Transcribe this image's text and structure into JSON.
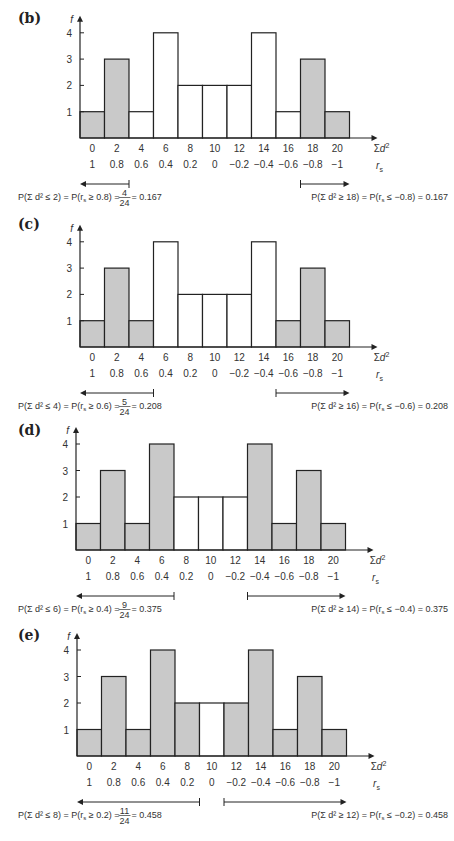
{
  "chart_data": [
    {
      "panel": "(b)",
      "type": "bar",
      "title": "",
      "ylabel": "f",
      "xlabel": "Σd²",
      "x2label": "r_s",
      "categories": [
        "0",
        "2",
        "4",
        "6",
        "8",
        "10",
        "12",
        "14",
        "16",
        "18",
        "20"
      ],
      "rs_labels": [
        "1",
        "0.8",
        "0.6",
        "0.4",
        "0.2",
        "0",
        "−0.2",
        "−0.4",
        "−0.6",
        "−0.8",
        "−1"
      ],
      "values": [
        1,
        3,
        1,
        4,
        2,
        2,
        2,
        4,
        1,
        3,
        1
      ],
      "shaded": [
        true,
        true,
        false,
        false,
        false,
        false,
        false,
        false,
        false,
        true,
        true
      ],
      "yticks": [
        1,
        2,
        3,
        4
      ],
      "ylim": [
        0,
        4
      ],
      "left_tail": {
        "text": "P(Σ d² ≤ 2) = P(r_s ≥ 0.8) = 4/24 = 0.167",
        "pre": "P(Σ d² ≤ 2) = P(r",
        "sub": "s",
        "post": " ≥ 0.8) = ",
        "num": "4",
        "den": "24",
        "result": " = 0.167",
        "from_bar": 0,
        "to_bar": 1
      },
      "right_tail": {
        "text": "P(Σ d² ≥ 18) = P(r_s ≤ −0.8) = 0.167",
        "pre": "P(Σ d² ≥ 18) = P(r",
        "sub": "s",
        "post": " ≤ −0.8) = 0.167",
        "from_bar": 9,
        "to_bar": 10
      }
    },
    {
      "panel": "(c)",
      "type": "bar",
      "ylabel": "f",
      "xlabel": "Σd²",
      "x2label": "r_s",
      "categories": [
        "0",
        "2",
        "4",
        "6",
        "8",
        "10",
        "12",
        "14",
        "16",
        "18",
        "20"
      ],
      "rs_labels": [
        "1",
        "0.8",
        "0.6",
        "0.4",
        "0.2",
        "0",
        "−0.2",
        "−0.4",
        "−0.6",
        "−0.8",
        "−1"
      ],
      "values": [
        1,
        3,
        1,
        4,
        2,
        2,
        2,
        4,
        1,
        3,
        1
      ],
      "shaded": [
        true,
        true,
        true,
        false,
        false,
        false,
        false,
        false,
        true,
        true,
        true
      ],
      "yticks": [
        1,
        2,
        3,
        4
      ],
      "ylim": [
        0,
        4
      ],
      "left_tail": {
        "text": "P(Σ d² ≤ 4) = P(r_s ≥ 0.6) = 5/24 = 0.208",
        "pre": "P(Σ d² ≤ 4) = P(r",
        "sub": "s",
        "post": " ≥ 0.6) = ",
        "num": "5",
        "den": "24",
        "result": " = 0.208",
        "from_bar": 0,
        "to_bar": 2
      },
      "right_tail": {
        "text": "P(Σ d² ≥ 16) = P(r_s ≤ −0.6) = 0.208",
        "pre": "P(Σ d² ≥ 16) = P(r",
        "sub": "s",
        "post": " ≤ −0.6) = 0.208",
        "from_bar": 8,
        "to_bar": 10
      }
    },
    {
      "panel": "(d)",
      "type": "bar",
      "ylabel": "f",
      "xlabel": "Σd²",
      "x2label": "r_s",
      "categories": [
        "0",
        "2",
        "4",
        "6",
        "8",
        "10",
        "12",
        "14",
        "16",
        "18",
        "20"
      ],
      "rs_labels": [
        "1",
        "0.8",
        "0.6",
        "0.4",
        "0.2",
        "0",
        "−0.2",
        "−0.4",
        "−0.6",
        "−0.8",
        "−1"
      ],
      "values": [
        1,
        3,
        1,
        4,
        2,
        2,
        2,
        4,
        1,
        3,
        1
      ],
      "shaded": [
        true,
        true,
        true,
        true,
        false,
        false,
        false,
        true,
        true,
        true,
        true
      ],
      "yticks": [
        1,
        2,
        3,
        4
      ],
      "ylim": [
        0,
        4
      ],
      "left_tail": {
        "text": "P(Σ d² ≤ 6) = P(r_s ≥ 0.4) = 9/24 = 0.375",
        "pre": "P(Σ d² ≤ 6) = P(r",
        "sub": "s",
        "post": " ≥ 0.4) = ",
        "num": "9",
        "den": "24",
        "result": " = 0.375",
        "from_bar": 0,
        "to_bar": 3
      },
      "right_tail": {
        "text": "P(Σ d² ≥ 14) = P(r_s ≤ −0.4) = 0.375",
        "pre": "P(Σ d² ≥ 14) = P(r",
        "sub": "s",
        "post": " ≤ −0.4) = 0.375",
        "from_bar": 7,
        "to_bar": 10
      }
    },
    {
      "panel": "(e)",
      "type": "bar",
      "ylabel": "f",
      "xlabel": "Σd²",
      "x2label": "r_s",
      "categories": [
        "0",
        "2",
        "4",
        "6",
        "8",
        "10",
        "12",
        "14",
        "16",
        "18",
        "20"
      ],
      "rs_labels": [
        "1",
        "0.8",
        "0.6",
        "0.4",
        "0.2",
        "0",
        "−0.2",
        "−0.4",
        "−0.6",
        "−0.8",
        "−1"
      ],
      "values": [
        1,
        3,
        1,
        4,
        2,
        2,
        2,
        4,
        1,
        3,
        1
      ],
      "shaded": [
        true,
        true,
        true,
        true,
        true,
        false,
        true,
        true,
        true,
        true,
        true
      ],
      "yticks": [
        1,
        2,
        3,
        4
      ],
      "ylim": [
        0,
        4
      ],
      "left_tail": {
        "text": "P(Σ d² ≤ 8) = P(r_s ≥ 0.2) = 11/24 = 0.458",
        "pre": "P(Σ d² ≤ 8) = P(r",
        "sub": "s",
        "post": " ≥ 0.2) = ",
        "num": "11",
        "den": "24",
        "result": " = 0.458",
        "from_bar": 0,
        "to_bar": 4
      },
      "right_tail": {
        "text": "P(Σ d² ≥ 12) = P(r_s ≤ −0.2) = 0.458",
        "pre": "P(Σ d² ≥ 12) = P(r",
        "sub": "s",
        "post": " ≤ −0.2) = 0.458",
        "from_bar": 6,
        "to_bar": 10
      }
    }
  ],
  "colors": {
    "shaded_fill": "#c9c9c9",
    "unshaded_fill": "#ffffff",
    "stroke": "#222222"
  },
  "layout": [
    {
      "top": 0,
      "axis_x": 80,
      "base_y": 138,
      "unit": 26.3,
      "bar_w": 24.5,
      "label_y": 20
    },
    {
      "top": 0,
      "axis_x": 80,
      "base_y": 347,
      "unit": 26.3,
      "bar_w": 24.5,
      "label_y": 226
    },
    {
      "top": 0,
      "axis_x": 76,
      "base_y": 550,
      "unit": 26.5,
      "bar_w": 24.5,
      "label_y": 432
    },
    {
      "top": 0,
      "axis_x": 77,
      "base_y": 756,
      "unit": 26.5,
      "bar_w": 24.5,
      "label_y": 637
    }
  ]
}
